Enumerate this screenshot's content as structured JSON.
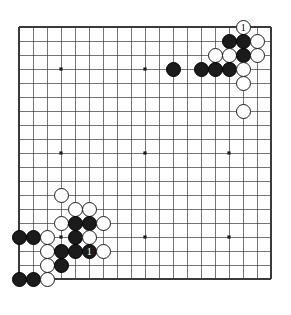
{
  "diagram": {
    "type": "go-board-diagram",
    "board_size": 19,
    "grid": {
      "origin_x": 19,
      "origin_y": 27,
      "spacing": 14,
      "line_color": "#3a3a3a",
      "border_color": "#3a3a3a",
      "background_color": "#ffffff",
      "star_point_indices": [
        3,
        9,
        15
      ],
      "star_point_color": "#1b1b1b"
    },
    "stone_colors": {
      "black": "#1b1b1b",
      "white": "#ffffff",
      "outline": "#1b1b1b",
      "black_label": "#ffffff",
      "white_label": "#000000"
    },
    "stones": [
      {
        "color": "white",
        "col": 16,
        "row": 0,
        "label": "1",
        "name": "white-move-1"
      },
      {
        "color": "black",
        "col": 15,
        "row": 1,
        "label": "",
        "name": "black-stone"
      },
      {
        "color": "black",
        "col": 16,
        "row": 1,
        "label": "",
        "name": "black-stone"
      },
      {
        "color": "white",
        "col": 17,
        "row": 1,
        "label": "",
        "name": "white-stone"
      },
      {
        "color": "white",
        "col": 14,
        "row": 2,
        "label": "",
        "name": "white-stone"
      },
      {
        "color": "white",
        "col": 15,
        "row": 2,
        "label": "",
        "name": "white-stone"
      },
      {
        "color": "black",
        "col": 16,
        "row": 2,
        "label": "",
        "name": "black-stone"
      },
      {
        "color": "white",
        "col": 17,
        "row": 2,
        "label": "",
        "name": "white-stone"
      },
      {
        "color": "black",
        "col": 11,
        "row": 3,
        "label": "",
        "name": "black-stone"
      },
      {
        "color": "black",
        "col": 13,
        "row": 3,
        "label": "",
        "name": "black-stone"
      },
      {
        "color": "black",
        "col": 14,
        "row": 3,
        "label": "",
        "name": "black-stone"
      },
      {
        "color": "black",
        "col": 15,
        "row": 3,
        "label": "",
        "name": "black-stone"
      },
      {
        "color": "white",
        "col": 16,
        "row": 3,
        "label": "",
        "name": "white-stone"
      },
      {
        "color": "white",
        "col": 16,
        "row": 4,
        "label": "",
        "name": "white-stone"
      },
      {
        "color": "white",
        "col": 16,
        "row": 6,
        "label": "",
        "name": "white-stone"
      },
      {
        "color": "white",
        "col": 3,
        "row": 12,
        "label": "",
        "name": "white-stone"
      },
      {
        "color": "white",
        "col": 4,
        "row": 13,
        "label": "",
        "name": "white-stone"
      },
      {
        "color": "white",
        "col": 5,
        "row": 13,
        "label": "",
        "name": "white-stone"
      },
      {
        "color": "white",
        "col": 3,
        "row": 14,
        "label": "",
        "name": "white-stone"
      },
      {
        "color": "black",
        "col": 4,
        "row": 14,
        "label": "",
        "name": "black-stone"
      },
      {
        "color": "black",
        "col": 5,
        "row": 14,
        "label": "",
        "name": "black-stone"
      },
      {
        "color": "white",
        "col": 6,
        "row": 14,
        "label": "",
        "name": "white-stone"
      },
      {
        "color": "black",
        "col": 0,
        "row": 15,
        "label": "",
        "name": "black-stone"
      },
      {
        "color": "black",
        "col": 1,
        "row": 15,
        "label": "",
        "name": "black-stone"
      },
      {
        "color": "white",
        "col": 2,
        "row": 15,
        "label": "",
        "name": "white-stone"
      },
      {
        "color": "black",
        "col": 4,
        "row": 15,
        "label": "",
        "name": "black-stone"
      },
      {
        "color": "white",
        "col": 5,
        "row": 15,
        "label": "",
        "name": "white-stone"
      },
      {
        "color": "white",
        "col": 2,
        "row": 16,
        "label": "",
        "name": "white-stone"
      },
      {
        "color": "black",
        "col": 3,
        "row": 16,
        "label": "",
        "name": "black-stone"
      },
      {
        "color": "black",
        "col": 4,
        "row": 16,
        "label": "",
        "name": "black-stone"
      },
      {
        "color": "black",
        "col": 5,
        "row": 16,
        "label": "1",
        "name": "black-move-1"
      },
      {
        "color": "white",
        "col": 6,
        "row": 16,
        "label": "",
        "name": "white-stone"
      },
      {
        "color": "white",
        "col": 2,
        "row": 17,
        "label": "",
        "name": "white-stone"
      },
      {
        "color": "black",
        "col": 3,
        "row": 17,
        "label": "",
        "name": "black-stone"
      },
      {
        "color": "black",
        "col": 0,
        "row": 18,
        "label": "",
        "name": "black-stone"
      },
      {
        "color": "black",
        "col": 1,
        "row": 18,
        "label": "",
        "name": "black-stone"
      },
      {
        "color": "white",
        "col": 2,
        "row": 18,
        "label": "",
        "name": "white-stone"
      }
    ]
  }
}
